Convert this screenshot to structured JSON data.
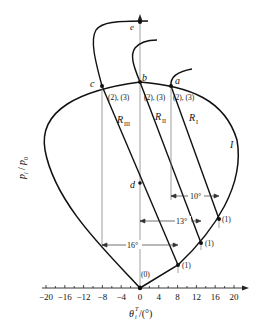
{
  "diagram": {
    "type": "shock polar diagram",
    "axes": {
      "x_label_main": "θ",
      "x_label_sup": "T",
      "x_label_sub": "i",
      "x_label_unit": "/(°)",
      "y_label": "p",
      "y_label_sub": "i",
      "y_label_slash": "/",
      "y_label2": "p",
      "y_label2_sub": "0",
      "x_ticks": [
        "−20",
        "−16",
        "−12",
        "−8",
        "−4",
        "0",
        "4",
        "8",
        "12",
        "16",
        "20"
      ]
    },
    "points": {
      "a": "a",
      "b": "b",
      "c": "c",
      "d": "d",
      "e": "e"
    },
    "curve_label": "I",
    "reflected_polars": {
      "r1_main": "R",
      "r1_sub": "I",
      "r2_main": "R",
      "r2_sub": "II",
      "r3_main": "R",
      "r3_sub": "III"
    },
    "state_labels": {
      "s0": "(0)",
      "s1": "(1)",
      "s23": "(2), (3)"
    },
    "angles": {
      "a10": "10°",
      "a13": "13°",
      "a16": "16°"
    }
  }
}
